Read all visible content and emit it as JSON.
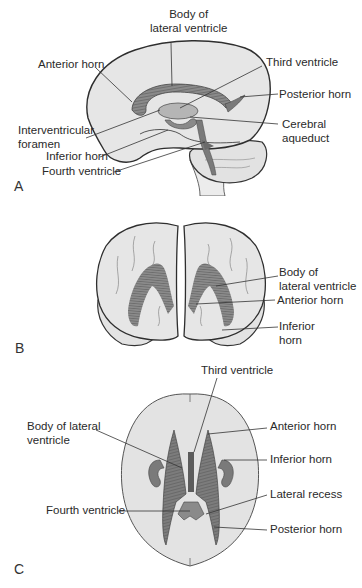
{
  "figure": {
    "colors": {
      "brain_fill": "#e6e6e6",
      "outline": "#333333",
      "ventricle": "#6e6e6e",
      "ventricle_dark": "#4a4a4a",
      "leader_line": "#333333",
      "text": "#2a2a2a"
    }
  },
  "panels": {
    "a": {
      "letter": "A",
      "view": "lateral",
      "labels": {
        "body_of_lateral_ventricle": "Body of\nlateral ventricle",
        "anterior_horn": "Anterior horn",
        "third_ventricle": "Third ventricle",
        "posterior_horn": "Posterior horn",
        "interventricular_foramen": "Interventricular\nforamen",
        "cerebral_aqueduct": "Cerebral\naqueduct",
        "inferior_horn": "Inferior horn",
        "fourth_ventricle": "Fourth ventricle"
      }
    },
    "b": {
      "letter": "B",
      "view": "anterior",
      "labels": {
        "body_of_lateral_ventricle": "Body of\nlateral ventricle",
        "anterior_horn": "Anterior horn",
        "inferior_horn": "Inferior\nhorn"
      }
    },
    "c": {
      "letter": "C",
      "view": "superior",
      "labels": {
        "third_ventricle": "Third ventricle",
        "body_of_lateral_ventricle": "Body of lateral\nventricle",
        "anterior_horn": "Anterior horn",
        "inferior_horn": "Inferior horn",
        "lateral_recess": "Lateral recess",
        "fourth_ventricle": "Fourth ventricle",
        "posterior_horn": "Posterior horn"
      }
    }
  }
}
